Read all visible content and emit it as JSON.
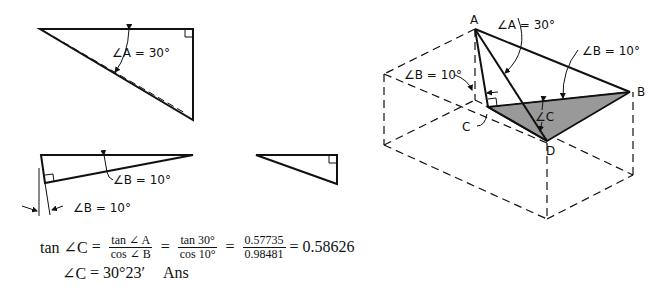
{
  "figure_left": {
    "triangle_top": {
      "angle_label": "∠A = 30°"
    },
    "triangle_bottom": {
      "angle_label_inner": "∠B = 10°",
      "angle_label_outer": "∠B = 10°"
    }
  },
  "figure_right": {
    "vertex_labels": {
      "a": "A",
      "b": "B",
      "c": "C",
      "d": "D"
    },
    "angle_a": "∠A = 30°",
    "angle_b_right": "∠B = 10°",
    "angle_b_left": "∠B = 10°",
    "angle_c": "∠C"
  },
  "formula": {
    "line1": {
      "lhs": "tan ∠C",
      "eq": "=",
      "frac1": {
        "num": "tan ∠ A",
        "den": "cos ∠ B"
      },
      "frac2": {
        "num": "tan 30°",
        "den": "cos 10°"
      },
      "frac3": {
        "num": "0.57735",
        "den": "0.98481"
      },
      "result": "= 0.58626"
    },
    "line2": {
      "lhs": "∠C",
      "eq": "=",
      "value": "30°23′",
      "suffix": "Ans"
    }
  }
}
